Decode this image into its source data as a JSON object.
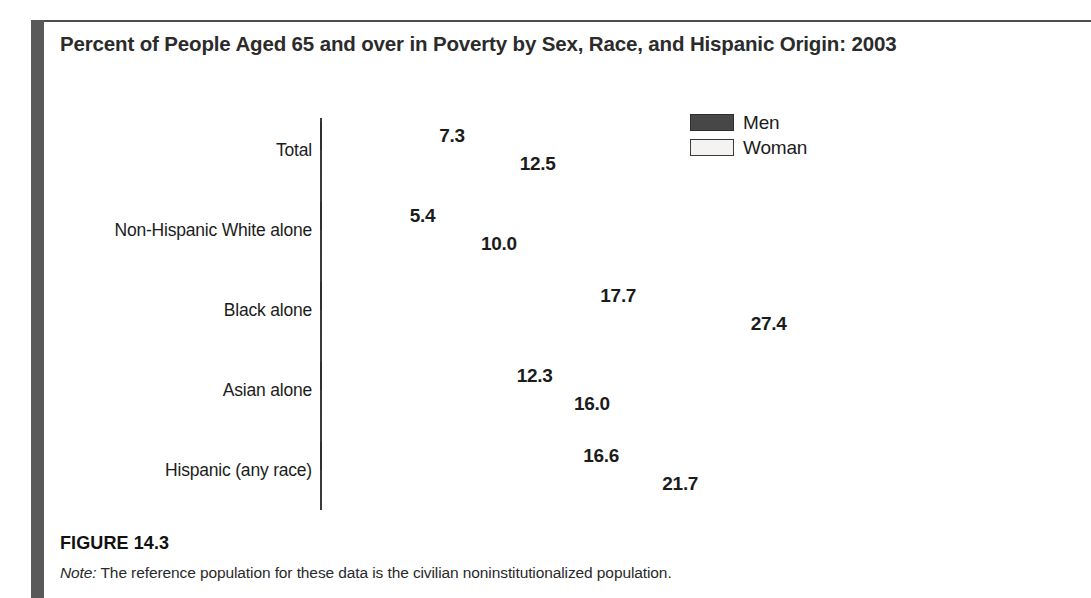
{
  "figure": {
    "title": "Percent of People Aged 65 and over in Poverty by Sex, Race, and Hispanic Origin: 2003",
    "number": "FIGURE 14.3",
    "note_lead": "Note:",
    "note_text": " The reference population for these data is the civilian noninstitutionalized population."
  },
  "legend": {
    "items": [
      {
        "label": "Men",
        "color": "#474747"
      },
      {
        "label": "Woman",
        "color": "#f4f3f1"
      }
    ]
  },
  "chart_data": {
    "type": "bar",
    "orientation": "horizontal",
    "title": "Percent of People Aged 65 and over in Poverty by Sex, Race, and Hispanic Origin: 2003",
    "xlabel": "",
    "ylabel": "",
    "grid": false,
    "legend_position": "top-right",
    "xlim": [
      0,
      27.4
    ],
    "axis_visible": "y-axis-only",
    "value_label_format": "one-decimal",
    "categories": [
      "Total",
      "Non-Hispanic White alone",
      "Black alone",
      "Asian alone",
      "Hispanic (any race)"
    ],
    "series": [
      {
        "name": "Men",
        "color": "#474747",
        "values": [
          7.3,
          5.4,
          17.7,
          12.3,
          16.6
        ],
        "labels": [
          "7.3",
          "5.4",
          "17.7",
          "12.3",
          "16.6"
        ]
      },
      {
        "name": "Woman",
        "color": "#f0efed",
        "values": [
          12.5,
          10.0,
          27.4,
          16.0,
          21.7
        ],
        "labels": [
          "12.5",
          "10.0",
          "27.4",
          "16.0",
          "21.7"
        ]
      }
    ]
  },
  "scale": {
    "px_per_unit": 15.5,
    "axis_x": 320,
    "first_row_y": 122,
    "group_pitch": 80,
    "bar_height": 28
  }
}
